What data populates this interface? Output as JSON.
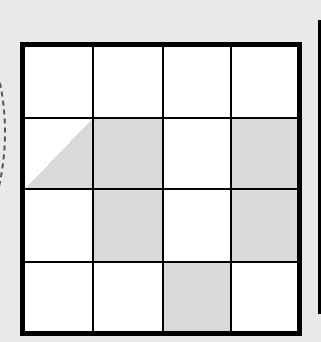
{
  "diagram": {
    "type": "grid-puzzle",
    "rows": 4,
    "cols": 4,
    "colors": {
      "background": "#e9e9e9",
      "cell_white": "#ffffff",
      "cell_shaded": "#d9d9d9",
      "line": "#000000"
    },
    "cells": [
      [
        "white",
        "white",
        "white",
        "white"
      ],
      [
        "half-shaded-lower-right",
        "shaded",
        "white",
        "shaded"
      ],
      [
        "white",
        "shaded",
        "white",
        "shaded"
      ],
      [
        "white",
        "white",
        "shaded",
        "white"
      ]
    ],
    "decorations": {
      "left_dashed_arc": true,
      "right_vertical_bar": true
    }
  }
}
